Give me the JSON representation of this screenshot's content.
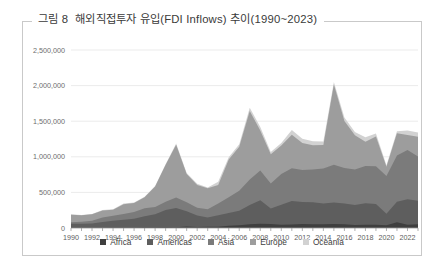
{
  "figure": {
    "caption_number": "그림 8",
    "caption_text": "해외직접투자 유입(FDI Inflows) 추이(1990~2023)"
  },
  "chart_data": {
    "type": "area",
    "stacked": true,
    "title": "해외직접투자 유입(FDI Inflows) 추이(1990~2023)",
    "xlabel": "",
    "ylabel": "",
    "grid": true,
    "legend_position": "bottom",
    "ylim": [
      0,
      2500000
    ],
    "yticks": [
      0,
      500000,
      1000000,
      1500000,
      2000000,
      2500000
    ],
    "ytick_labels": [
      "0",
      "500,000",
      "1,000,000",
      "1,500,000",
      "2,000,000",
      "2,500,000"
    ],
    "x": [
      1990,
      1991,
      1992,
      1993,
      1994,
      1995,
      1996,
      1997,
      1998,
      1999,
      2000,
      2001,
      2002,
      2003,
      2004,
      2005,
      2006,
      2007,
      2008,
      2009,
      2010,
      2011,
      2012,
      2013,
      2014,
      2015,
      2016,
      2017,
      2018,
      2019,
      2020,
      2021,
      2022,
      2023
    ],
    "xtick_labels": [
      "1990",
      "1992",
      "1994",
      "1996",
      "1998",
      "2000",
      "2002",
      "2004",
      "2006",
      "2008",
      "2010",
      "2012",
      "2014",
      "2016",
      "2018",
      "2020",
      "2022"
    ],
    "series": [
      {
        "name": "Africa",
        "color": "#3f3f3f",
        "values": [
          2800,
          3300,
          3400,
          5200,
          6000,
          5500,
          6200,
          11000,
          9500,
          12500,
          9600,
          20000,
          15000,
          18500,
          18000,
          31000,
          37000,
          52000,
          59000,
          55000,
          47000,
          49000,
          55000,
          52000,
          54000,
          57000,
          53000,
          42000,
          46000,
          46000,
          39000,
          80000,
          45000,
          53000
        ]
      },
      {
        "name": "Americas",
        "color": "#5e5e5e",
        "values": [
          56000,
          58000,
          60000,
          80000,
          95000,
          110000,
          125000,
          155000,
          185000,
          240000,
          270000,
          215000,
          160000,
          130000,
          160000,
          180000,
          205000,
          270000,
          330000,
          220000,
          280000,
          330000,
          310000,
          310000,
          290000,
          300000,
          290000,
          280000,
          300000,
          290000,
          160000,
          290000,
          360000,
          330000
        ]
      },
      {
        "name": "Asia",
        "color": "#7b7b7b",
        "values": [
          22000,
          27000,
          38000,
          62000,
          72000,
          82000,
          94000,
          110000,
          100000,
          115000,
          150000,
          125000,
          110000,
          115000,
          165000,
          220000,
          280000,
          360000,
          420000,
          350000,
          430000,
          460000,
          450000,
          460000,
          490000,
          530000,
          500000,
          500000,
          525000,
          530000,
          530000,
          650000,
          690000,
          620000
        ]
      },
      {
        "name": "Europe",
        "color": "#9d9d9d",
        "values": [
          105000,
          90000,
          90000,
          100000,
          85000,
          135000,
          125000,
          155000,
          290000,
          520000,
          740000,
          400000,
          320000,
          295000,
          260000,
          530000,
          620000,
          960000,
          560000,
          410000,
          400000,
          470000,
          380000,
          340000,
          330000,
          1130000,
          660000,
          480000,
          340000,
          420000,
          130000,
          310000,
          210000,
          280000
        ]
      },
      {
        "name": "Oceania",
        "color": "#d2d2d2",
        "values": [
          8000,
          6000,
          5000,
          6000,
          6000,
          13000,
          7000,
          9000,
          7000,
          9000,
          16000,
          12000,
          18000,
          11000,
          45000,
          32000,
          33000,
          48000,
          50000,
          32000,
          38000,
          68000,
          60000,
          56000,
          52000,
          32000,
          48000,
          46000,
          62000,
          40000,
          22000,
          28000,
          66000,
          58000
        ]
      }
    ]
  },
  "legend": {
    "items": [
      {
        "label": "Africa",
        "color": "#3f3f3f"
      },
      {
        "label": "Americas",
        "color": "#5e5e5e"
      },
      {
        "label": "Asia",
        "color": "#7b7b7b"
      },
      {
        "label": "Europe",
        "color": "#9d9d9d"
      },
      {
        "label": "Oceania",
        "color": "#d2d2d2"
      }
    ]
  }
}
